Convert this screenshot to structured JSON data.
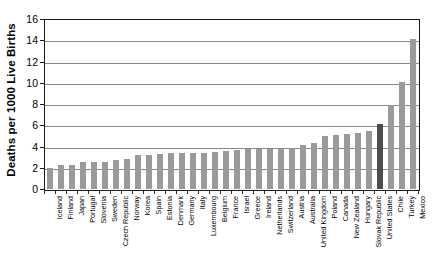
{
  "chart_data": {
    "type": "bar",
    "title": "",
    "subtitle": "",
    "xlabel": "",
    "ylabel": "Deaths per 1000 Live Births",
    "ylim": [
      0,
      16
    ],
    "yticks": [
      0,
      2,
      4,
      6,
      8,
      10,
      12,
      14,
      16
    ],
    "ytick_labels": [
      "0",
      "2",
      "4",
      "6",
      "8",
      "10",
      "12",
      "14",
      "16"
    ],
    "grid": "horizontal",
    "legend": "none",
    "orientation": "vertical",
    "bar_color": "#9a9a9a",
    "highlight_color": "#4d4d4d",
    "highlight_category": "United States",
    "categories": [
      "Iceland",
      "Finland",
      "Japan",
      "Portugal",
      "Slovenia",
      "Sweden",
      "Czech Republic",
      "Norway",
      "Korea",
      "Spain",
      "Estonia",
      "Denmark",
      "Germany",
      "Italy",
      "Luxembourg",
      "Belgium",
      "France",
      "Israel",
      "Greece",
      "Ireland",
      "Netherlands",
      "Switzerland",
      "Austria",
      "Australia",
      "United Kingdom",
      "Poland",
      "Canada",
      "New Zealand",
      "Hungary",
      "Slovak Republic",
      "United States",
      "Chile",
      "Turkey",
      "Mexico"
    ],
    "values": [
      2.0,
      2.3,
      2.3,
      2.5,
      2.5,
      2.5,
      2.7,
      2.8,
      3.2,
      3.2,
      3.3,
      3.4,
      3.4,
      3.4,
      3.4,
      3.5,
      3.6,
      3.7,
      3.8,
      3.8,
      3.8,
      3.8,
      3.9,
      4.1,
      4.3,
      5.0,
      5.1,
      5.2,
      5.3,
      5.5,
      6.1,
      7.9,
      10.1,
      14.1
    ]
  }
}
